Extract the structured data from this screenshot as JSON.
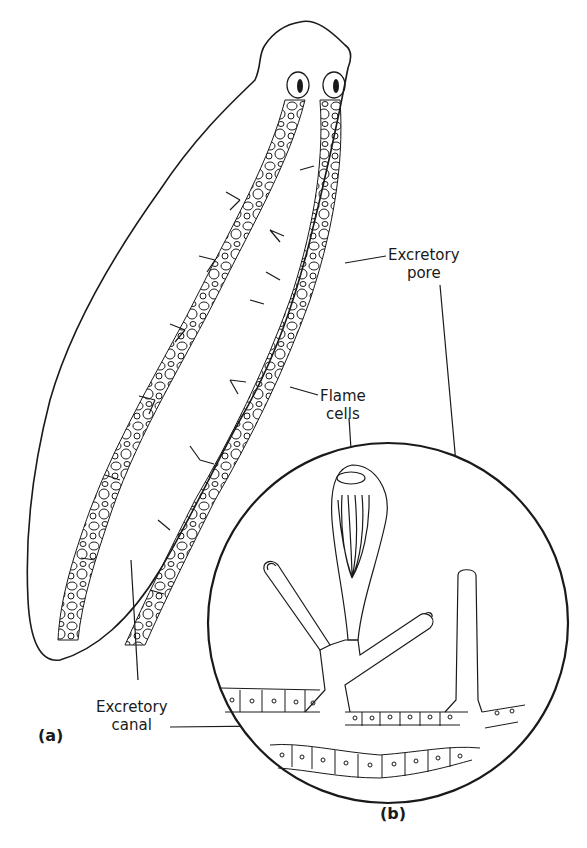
{
  "figure": {
    "panels": [
      {
        "id": "a",
        "label": "(a)",
        "description": "Whole flatworm with branching excretory canal network on both sides"
      },
      {
        "id": "b",
        "label": "(b)",
        "description": "Magnified circular inset of flame cells branching from excretory canal"
      }
    ],
    "labels": {
      "excretory_pore_line1": "Excretory",
      "excretory_pore_line2": "pore",
      "flame_cells_line1": "Flame",
      "flame_cells_line2": "cells",
      "excretory_canal_line1": "Excretory",
      "excretory_canal_line2": "canal"
    },
    "colors": {
      "ink": "#1a1a1a",
      "background": "#ffffff"
    }
  }
}
